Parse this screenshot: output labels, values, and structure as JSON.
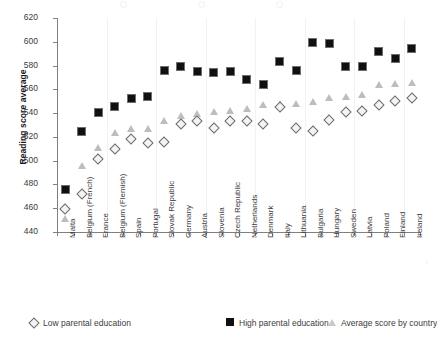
{
  "chart_data": {
    "type": "scatter",
    "title": "",
    "xlabel": "",
    "ylabel": "Reading score average",
    "ylim": [
      440,
      620
    ],
    "ytick_step": 20,
    "yticks": [
      440,
      460,
      480,
      500,
      520,
      540,
      560,
      580,
      600,
      620
    ],
    "grid": "vertical-light",
    "legend_position": "bottom",
    "categories": [
      "Malta",
      "Belgium (French)",
      "France",
      "Belgium (Flemish)",
      "Spain",
      "Portugal",
      "Slovak Republic",
      "Germany",
      "Austria",
      "Slovenia",
      "Czech Republic",
      "Netherlands",
      "Denmark",
      "Italy",
      "Lithuania",
      "Bulgaria",
      "Hungary",
      "Sweden",
      "Latvia",
      "Poland",
      "Finland",
      "Ireland"
    ],
    "series": [
      {
        "name": "Low parental education",
        "marker": "diamond-open",
        "color": "#6a6a6a",
        "values": [
          459,
          472,
          501,
          510,
          518,
          515,
          516,
          531,
          533,
          527,
          533,
          533,
          531,
          545,
          527,
          525,
          534,
          541,
          542,
          547,
          550,
          553
        ]
      },
      {
        "name": "High parental education",
        "marker": "square-filled",
        "color": "#101010",
        "values": [
          476,
          524,
          540,
          545,
          552,
          554,
          576,
          579,
          575,
          574,
          575,
          568,
          564,
          583,
          576,
          599,
          598,
          579,
          579,
          592,
          586,
          594
        ]
      },
      {
        "name": "Average score by country",
        "marker": "triangle-filled",
        "color": "#bdbdbd",
        "values": [
          451,
          496,
          511,
          524,
          527,
          527,
          534,
          538,
          540,
          541,
          542,
          544,
          547,
          548,
          548,
          550,
          553,
          554,
          556,
          564,
          565,
          566
        ]
      }
    ]
  },
  "legend": [
    {
      "label": "Low parental education",
      "marker": "diamond-open"
    },
    {
      "label": "High parental education",
      "marker": "square-filled"
    },
    {
      "label": "Average score by country",
      "marker": "triangle-filled"
    }
  ],
  "axis": {
    "y_title": "Reading score average"
  }
}
